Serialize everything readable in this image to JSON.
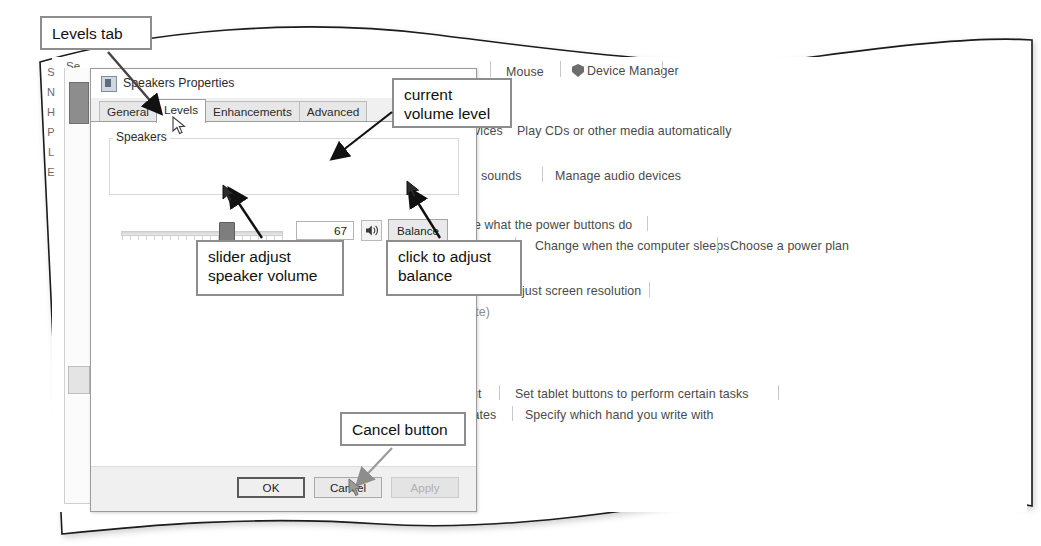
{
  "annotations": [
    {
      "id": "levels",
      "text": "Levels tab"
    },
    {
      "id": "volume",
      "line1": "current",
      "line2": "volume level"
    },
    {
      "id": "slider",
      "line1": "slider adjust",
      "line2": "speaker volume"
    },
    {
      "id": "balance",
      "line1": "click to adjust",
      "line2": "balance"
    },
    {
      "id": "cancel",
      "text": "Cancel button"
    }
  ],
  "dialog": {
    "title": "Speakers Properties",
    "close_label": "✕",
    "icon": "speaker-properties-icon",
    "tabs": [
      {
        "label": "General",
        "active": false
      },
      {
        "label": "Levels",
        "active": true
      },
      {
        "label": "Enhancements",
        "active": false
      },
      {
        "label": "Advanced",
        "active": false
      }
    ],
    "group": {
      "legend": "Speakers",
      "volume_value": "67",
      "slider_percent": 67,
      "mute_icon": "speaker-volume-icon",
      "balance_label": "Balance"
    },
    "footer": {
      "ok_label": "OK",
      "cancel_label": "Cancel",
      "apply_label": "Apply",
      "apply_disabled": true
    }
  },
  "background": {
    "hidden_window_letters": [
      "S",
      "N",
      "H",
      "P",
      "L",
      "E"
    ],
    "hidden_window_title": "Se",
    "links": [
      {
        "id": "p-partial",
        "text": "p"
      },
      {
        "id": "mouse",
        "text": "Mouse"
      },
      {
        "id": "device-manager",
        "text": "Device Manager",
        "icon": "shield-icon"
      },
      {
        "id": "devices-partial",
        "text": "evices"
      },
      {
        "id": "play-cds",
        "text": "Play CDs or other media automatically"
      },
      {
        "id": "system-sounds",
        "text": "em sounds"
      },
      {
        "id": "manage-audio",
        "text": "Manage audio devices"
      },
      {
        "id": "power-buttons",
        "text": "nge what the power buttons do"
      },
      {
        "id": "speaker-partial",
        "text": "eaker"
      },
      {
        "id": "computer-sleeps",
        "text": "Change when the computer sleeps"
      },
      {
        "id": "power-plan",
        "text": "Choose a power plan"
      },
      {
        "id": "screen-resolution",
        "text": "djust screen resolution"
      },
      {
        "id": "rate-partial",
        "text": "rate)"
      },
      {
        "id": "input-partial",
        "text": "put"
      },
      {
        "id": "tablet-buttons",
        "text": "Set tablet buttons to perform certain tasks"
      },
      {
        "id": "rotates-partial",
        "text": "otates"
      },
      {
        "id": "which-hand",
        "text": "Specify which hand you write with"
      }
    ]
  },
  "colors": {
    "callout_border": "#8d8d8d",
    "page_border": "#1a1a1a",
    "slider_thumb": "#7e7e7e",
    "link_text": "#4a4a4a"
  }
}
